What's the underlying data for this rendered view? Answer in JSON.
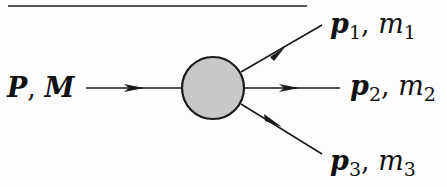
{
  "diagram": {
    "incoming": {
      "momentum": "P",
      "mass": "M"
    },
    "outgoing": [
      {
        "momentum": "p",
        "index": "1",
        "mass": "m",
        "mass_index": "1"
      },
      {
        "momentum": "p",
        "index": "2",
        "mass": "m",
        "mass_index": "2"
      },
      {
        "momentum": "p",
        "index": "3",
        "mass": "m",
        "mass_index": "3"
      }
    ],
    "separator": ",",
    "colors": {
      "blob_fill": "#c8c8c8",
      "stroke": "#1a1a1a"
    }
  }
}
